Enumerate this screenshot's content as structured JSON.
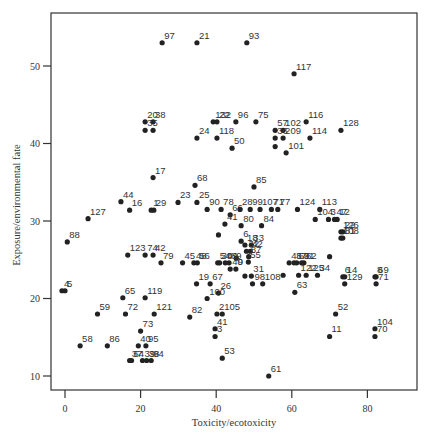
{
  "chart_data": {
    "type": "scatter",
    "title": "",
    "xlabel": "Toxicity/ecotoxicity",
    "ylabel": "Exposure/environmental fate",
    "xlim": [
      -2,
      94
    ],
    "ylim": [
      8.2,
      56.7
    ],
    "xticks": [
      0,
      20,
      40,
      60,
      80
    ],
    "yticks": [
      10,
      20,
      30,
      40,
      50
    ],
    "grid": false,
    "legend": null,
    "marker_color": "#222222",
    "points": [
      {
        "label": "97",
        "x": 25.7,
        "y": 53.0
      },
      {
        "label": "21",
        "x": 34.9,
        "y": 53.0
      },
      {
        "label": "93",
        "x": 48.1,
        "y": 53.0
      },
      {
        "label": "117",
        "x": 60.6,
        "y": 49.0
      },
      {
        "label": "20",
        "x": 21.2,
        "y": 42.8
      },
      {
        "label": "38",
        "x": 23.3,
        "y": 42.8
      },
      {
        "label": "35",
        "x": 21.2,
        "y": 41.7
      },
      {
        "label": "",
        "x": 23.3,
        "y": 41.7
      },
      {
        "label": "132",
        "x": 39.2,
        "y": 42.8
      },
      {
        "label": "22",
        "x": 40.2,
        "y": 42.8
      },
      {
        "label": "96",
        "x": 45.2,
        "y": 42.8
      },
      {
        "label": "75",
        "x": 50.5,
        "y": 42.8
      },
      {
        "label": "24",
        "x": 34.9,
        "y": 40.7
      },
      {
        "label": "118",
        "x": 40.2,
        "y": 40.7
      },
      {
        "label": "50",
        "x": 44.2,
        "y": 39.4
      },
      {
        "label": "57",
        "x": 55.6,
        "y": 41.7
      },
      {
        "label": "102",
        "x": 57.7,
        "y": 41.7
      },
      {
        "label": "209",
        "x": 57.7,
        "y": 40.7
      },
      {
        "label": "36",
        "x": 55.6,
        "y": 40.7
      },
      {
        "label": "",
        "x": 55.6,
        "y": 39.6
      },
      {
        "label": "116",
        "x": 63.8,
        "y": 42.8
      },
      {
        "label": "114",
        "x": 64.8,
        "y": 40.7
      },
      {
        "label": "128",
        "x": 73.0,
        "y": 41.7
      },
      {
        "label": "101",
        "x": 58.5,
        "y": 38.8
      },
      {
        "label": "17",
        "x": 23.3,
        "y": 35.6
      },
      {
        "label": "68",
        "x": 34.4,
        "y": 34.6
      },
      {
        "label": "44",
        "x": 14.8,
        "y": 32.5
      },
      {
        "label": "16",
        "x": 17.1,
        "y": 31.4
      },
      {
        "label": "127",
        "x": 6.1,
        "y": 30.3
      },
      {
        "label": "1",
        "x": 22.8,
        "y": 31.4
      },
      {
        "label": "29",
        "x": 23.5,
        "y": 31.4
      },
      {
        "label": "23",
        "x": 29.9,
        "y": 32.4
      },
      {
        "label": "25",
        "x": 34.9,
        "y": 32.4
      },
      {
        "label": "88",
        "x": 0.6,
        "y": 27.3
      },
      {
        "label": "85",
        "x": 50.0,
        "y": 34.4
      },
      {
        "label": "90",
        "x": 37.6,
        "y": 31.5
      },
      {
        "label": "78",
        "x": 41.3,
        "y": 31.5
      },
      {
        "label": "66",
        "x": 43.7,
        "y": 30.8
      },
      {
        "label": "41",
        "x": 42.3,
        "y": 29.6
      },
      {
        "label": "28",
        "x": 46.3,
        "y": 31.5
      },
      {
        "label": "99",
        "x": 49.0,
        "y": 31.5
      },
      {
        "label": "107",
        "x": 51.6,
        "y": 31.5
      },
      {
        "label": "71",
        "x": 54.6,
        "y": 31.5
      },
      {
        "label": "77",
        "x": 56.3,
        "y": 31.5
      },
      {
        "label": "124",
        "x": 61.5,
        "y": 31.5
      },
      {
        "label": "80",
        "x": 46.6,
        "y": 29.4
      },
      {
        "label": "84",
        "x": 52.0,
        "y": 29.4
      },
      {
        "label": "",
        "x": 40.6,
        "y": 28.2
      },
      {
        "label": "6",
        "x": 46.6,
        "y": 27.4
      },
      {
        "label": "18",
        "x": 47.6,
        "y": 26.9
      },
      {
        "label": "33",
        "x": 49.3,
        "y": 26.9
      },
      {
        "label": "42",
        "x": 49.0,
        "y": 26.1
      },
      {
        "label": "32",
        "x": 48.0,
        "y": 26.1
      },
      {
        "label": "87",
        "x": 48.6,
        "y": 25.4
      },
      {
        "label": "",
        "x": 45.3,
        "y": 25.2
      },
      {
        "label": "113",
        "x": 67.4,
        "y": 31.5
      },
      {
        "label": "104",
        "x": 66.2,
        "y": 30.2
      },
      {
        "label": "3",
        "x": 69.7,
        "y": 30.2
      },
      {
        "label": "12",
        "x": 72.0,
        "y": 30.2
      },
      {
        "label": "47",
        "x": 71.3,
        "y": 30.2
      },
      {
        "label": "126",
        "x": 73.0,
        "y": 28.6
      },
      {
        "label": "22",
        "x": 73.5,
        "y": 28.6
      },
      {
        "label": "108",
        "x": 73.0,
        "y": 27.8
      },
      {
        "label": "81",
        "x": 73.5,
        "y": 27.8
      },
      {
        "label": "",
        "x": 70.0,
        "y": 25.4
      },
      {
        "label": "34",
        "x": 66.8,
        "y": 23.0
      },
      {
        "label": "123",
        "x": 16.6,
        "y": 25.6
      },
      {
        "label": "74",
        "x": 21.2,
        "y": 25.6
      },
      {
        "label": "42",
        "x": 23.3,
        "y": 25.6
      },
      {
        "label": "79",
        "x": 25.4,
        "y": 24.6
      },
      {
        "label": "45",
        "x": 31.1,
        "y": 24.6
      },
      {
        "label": "48",
        "x": 34.1,
        "y": 24.6
      },
      {
        "label": "56",
        "x": 35.0,
        "y": 24.6
      },
      {
        "label": "54",
        "x": 40.4,
        "y": 24.6
      },
      {
        "label": "30",
        "x": 40.9,
        "y": 24.6
      },
      {
        "label": "49",
        "x": 42.4,
        "y": 24.6
      },
      {
        "label": "89",
        "x": 43.4,
        "y": 24.6
      },
      {
        "label": "40",
        "x": 43.7,
        "y": 23.8
      },
      {
        "label": "9",
        "x": 45.2,
        "y": 23.8
      },
      {
        "label": "19",
        "x": 34.8,
        "y": 21.9
      },
      {
        "label": "67",
        "x": 38.4,
        "y": 21.9
      },
      {
        "label": "26",
        "x": 40.6,
        "y": 20.7
      },
      {
        "label": "55",
        "x": 48.5,
        "y": 24.7
      },
      {
        "label": "31",
        "x": 49.3,
        "y": 22.9
      },
      {
        "label": "",
        "x": 47.6,
        "y": 22.9
      },
      {
        "label": "98",
        "x": 49.6,
        "y": 21.9
      },
      {
        "label": "108",
        "x": 52.3,
        "y": 21.9
      },
      {
        "label": "46",
        "x": 59.3,
        "y": 24.6
      },
      {
        "label": "63",
        "x": 61.3,
        "y": 24.6
      },
      {
        "label": "62",
        "x": 63.2,
        "y": 24.6
      },
      {
        "label": "37",
        "x": 60.6,
        "y": 24.6
      },
      {
        "label": "91",
        "x": 62.6,
        "y": 24.6
      },
      {
        "label": "122",
        "x": 61.8,
        "y": 23.0
      },
      {
        "label": "125",
        "x": 63.8,
        "y": 23.0
      },
      {
        "label": "",
        "x": 57.7,
        "y": 23.0
      },
      {
        "label": "6",
        "x": 73.5,
        "y": 22.8
      },
      {
        "label": "14",
        "x": 74.0,
        "y": 22.8
      },
      {
        "label": "129",
        "x": 74.0,
        "y": 21.9
      },
      {
        "label": "8",
        "x": 82.0,
        "y": 22.8
      },
      {
        "label": "69",
        "x": 82.3,
        "y": 22.8
      },
      {
        "label": "71",
        "x": 82.3,
        "y": 21.9
      },
      {
        "label": "4",
        "x": -0.8,
        "y": 21.0
      },
      {
        "label": "5",
        "x": 0.0,
        "y": 21.0
      },
      {
        "label": "63",
        "x": 60.8,
        "y": 20.8
      },
      {
        "label": "100",
        "x": 37.6,
        "y": 20.0
      },
      {
        "label": "2",
        "x": 40.2,
        "y": 18.0
      },
      {
        "label": "105",
        "x": 41.6,
        "y": 18.0
      },
      {
        "label": "52",
        "x": 71.6,
        "y": 18.0
      },
      {
        "label": "82",
        "x": 33.0,
        "y": 17.6
      },
      {
        "label": "41",
        "x": 39.7,
        "y": 16.1
      },
      {
        "label": "3",
        "x": 39.7,
        "y": 15.1
      },
      {
        "label": "11",
        "x": 70.0,
        "y": 15.1
      },
      {
        "label": "104",
        "x": 82.0,
        "y": 16.1
      },
      {
        "label": "70",
        "x": 82.0,
        "y": 15.1
      },
      {
        "label": "65",
        "x": 15.3,
        "y": 20.1
      },
      {
        "label": "72",
        "x": 16.0,
        "y": 18.0
      },
      {
        "label": "119",
        "x": 21.2,
        "y": 20.1
      },
      {
        "label": "121",
        "x": 23.6,
        "y": 18.0
      },
      {
        "label": "59",
        "x": 8.6,
        "y": 18.0
      },
      {
        "label": "73",
        "x": 20.0,
        "y": 15.8
      },
      {
        "label": "40",
        "x": 19.4,
        "y": 13.9
      },
      {
        "label": "95",
        "x": 21.4,
        "y": 13.9
      },
      {
        "label": "58",
        "x": 4.0,
        "y": 13.9
      },
      {
        "label": "86",
        "x": 11.2,
        "y": 13.9
      },
      {
        "label": "37",
        "x": 17.1,
        "y": 12.0
      },
      {
        "label": "64",
        "x": 17.6,
        "y": 12.0
      },
      {
        "label": "39",
        "x": 20.5,
        "y": 12.0
      },
      {
        "label": "38",
        "x": 21.6,
        "y": 12.0
      },
      {
        "label": "94",
        "x": 22.8,
        "y": 12.0
      },
      {
        "label": "53",
        "x": 41.6,
        "y": 12.3
      },
      {
        "label": "61",
        "x": 53.9,
        "y": 10.0
      }
    ]
  }
}
